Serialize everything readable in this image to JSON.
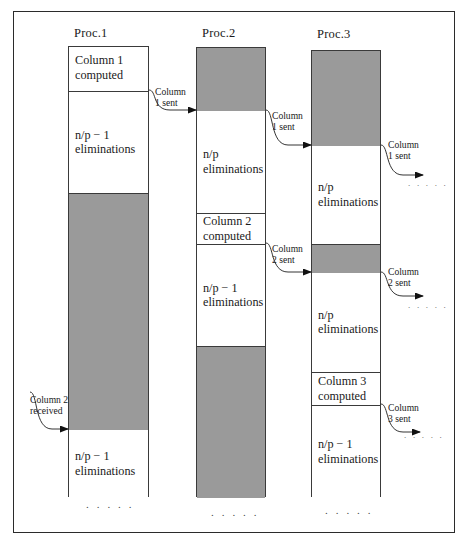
{
  "figure": {
    "frame_color": "#2b2b2b",
    "busy_color": "#9a9a9a",
    "idle_color": "#ffffff"
  },
  "processors": [
    {
      "title": "Proc.1",
      "segments": [
        {
          "kind": "idle",
          "label": "Column 1\ncomputed"
        },
        {
          "kind": "idle",
          "label": "n/p − 1\neliminations"
        },
        {
          "kind": "busy",
          "label": ""
        },
        {
          "kind": "idle",
          "label": "n/p − 1\neliminations"
        }
      ],
      "dots": ". . . . ."
    },
    {
      "title": "Proc.2",
      "segments": [
        {
          "kind": "busy",
          "label": ""
        },
        {
          "kind": "idle",
          "label": "n/p\neliminations"
        },
        {
          "kind": "idle",
          "label": "Column 2\ncomputed"
        },
        {
          "kind": "idle",
          "label": "n/p − 1\neliminations"
        },
        {
          "kind": "busy",
          "label": ""
        }
      ],
      "dots": ". . . . ."
    },
    {
      "title": "Proc.3",
      "segments": [
        {
          "kind": "busy",
          "label": ""
        },
        {
          "kind": "idle",
          "label": "n/p\neliminations"
        },
        {
          "kind": "busy",
          "label": ""
        },
        {
          "kind": "idle",
          "label": "n/p\neliminations"
        },
        {
          "kind": "idle",
          "label": "Column 3\ncomputed"
        },
        {
          "kind": "idle",
          "label": "n/p − 1\neliminations"
        }
      ],
      "dots": ". . . . ."
    }
  ],
  "messages": [
    {
      "id": "m1",
      "line1": "Column",
      "line2": "1 sent"
    },
    {
      "id": "m2",
      "line1": "Column",
      "line2": "1 sent"
    },
    {
      "id": "m3",
      "line1": "Column",
      "line2": "1 sent"
    },
    {
      "id": "m4",
      "line1": "Column",
      "line2": "2 sent"
    },
    {
      "id": "m5",
      "line1": "Column",
      "line2": "2 sent"
    },
    {
      "id": "m6",
      "line1": "Column 2",
      "line2": "received"
    },
    {
      "id": "m7",
      "line1": "Column",
      "line2": "3 sent"
    }
  ],
  "trailing_dots": [
    {
      "id": "t1",
      "text": ". . . . ."
    },
    {
      "id": "t2",
      "text": ". . . . ."
    },
    {
      "id": "t3",
      "text": ". . . . ."
    }
  ]
}
